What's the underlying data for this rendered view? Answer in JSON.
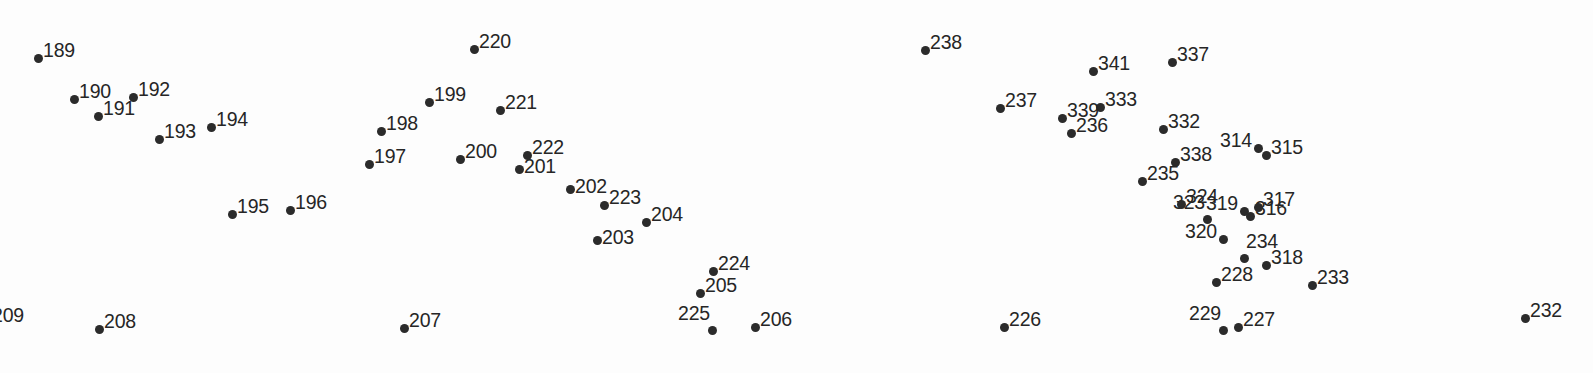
{
  "figure": {
    "type": "scatter-labeled-points",
    "width": 1593,
    "height": 373,
    "background_color": "#fdfdfd",
    "dot_color": "#2b2b2b",
    "label_color": "#262626",
    "label_font_size_px": 19.5,
    "dot_diameter_px": 9,
    "title": "",
    "xlabel": "",
    "ylabel": "",
    "grid": false,
    "axes_visible": false,
    "legend": "none"
  },
  "chart_data": {
    "type": "scatter",
    "title": "",
    "xlabel": "",
    "ylabel": "",
    "grid": false,
    "legend": "none",
    "xlim": [
      0,
      1593
    ],
    "ylim": [
      0,
      373
    ],
    "note": "Each point is a filled dot annotated with a numeric identifier label. Coordinates are in screenshot pixel space; y increases downward.",
    "points": [
      {
        "label": "189",
        "x": 38,
        "y": 58,
        "label_pos": "right"
      },
      {
        "label": "190",
        "x": 74,
        "y": 99,
        "label_pos": "right"
      },
      {
        "label": "191",
        "x": 98,
        "y": 116,
        "label_pos": "right"
      },
      {
        "label": "192",
        "x": 133,
        "y": 97,
        "label_pos": "right"
      },
      {
        "label": "193",
        "x": 159,
        "y": 139,
        "label_pos": "right"
      },
      {
        "label": "194",
        "x": 211,
        "y": 127,
        "label_pos": "right"
      },
      {
        "label": "195",
        "x": 232,
        "y": 214,
        "label_pos": "right"
      },
      {
        "label": "196",
        "x": 290,
        "y": 210,
        "label_pos": "right"
      },
      {
        "label": "197",
        "x": 369,
        "y": 164,
        "label_pos": "right"
      },
      {
        "label": "198",
        "x": 381,
        "y": 131,
        "label_pos": "right"
      },
      {
        "label": "199",
        "x": 429,
        "y": 102,
        "label_pos": "right"
      },
      {
        "label": "200",
        "x": 460,
        "y": 159,
        "label_pos": "right"
      },
      {
        "label": "201",
        "x": 519,
        "y": 169,
        "label_pos": "right-low"
      },
      {
        "label": "202",
        "x": 570,
        "y": 189,
        "label_pos": "right-low"
      },
      {
        "label": "203",
        "x": 597,
        "y": 240,
        "label_pos": "right-low"
      },
      {
        "label": "204",
        "x": 646,
        "y": 222,
        "label_pos": "right"
      },
      {
        "label": "205",
        "x": 700,
        "y": 293,
        "label_pos": "right"
      },
      {
        "label": "206",
        "x": 755,
        "y": 327,
        "label_pos": "right"
      },
      {
        "label": "207",
        "x": 404,
        "y": 328,
        "label_pos": "right"
      },
      {
        "label": "208",
        "x": 99,
        "y": 329,
        "label_pos": "right"
      },
      {
        "label": "209",
        "x": 0,
        "y": 318,
        "label_pos": "clipped-left"
      },
      {
        "label": "220",
        "x": 474,
        "y": 49,
        "label_pos": "right"
      },
      {
        "label": "221",
        "x": 500,
        "y": 110,
        "label_pos": "right"
      },
      {
        "label": "222",
        "x": 527,
        "y": 155,
        "label_pos": "right"
      },
      {
        "label": "223",
        "x": 604,
        "y": 205,
        "label_pos": "right"
      },
      {
        "label": "224",
        "x": 713,
        "y": 271,
        "label_pos": "right"
      },
      {
        "label": "225",
        "x": 712,
        "y": 330,
        "label_pos": "top-left"
      },
      {
        "label": "226",
        "x": 1004,
        "y": 327,
        "label_pos": "right"
      },
      {
        "label": "227",
        "x": 1238,
        "y": 327,
        "label_pos": "right"
      },
      {
        "label": "228",
        "x": 1216,
        "y": 282,
        "label_pos": "right"
      },
      {
        "label": "229",
        "x": 1223,
        "y": 330,
        "label_pos": "top-left"
      },
      {
        "label": "232",
        "x": 1525,
        "y": 318,
        "label_pos": "right"
      },
      {
        "label": "233",
        "x": 1312,
        "y": 285,
        "label_pos": "right"
      },
      {
        "label": "234",
        "x": 1244,
        "y": 258,
        "label_pos": "top-right"
      },
      {
        "label": "235",
        "x": 1142,
        "y": 181,
        "label_pos": "right"
      },
      {
        "label": "236",
        "x": 1071,
        "y": 133,
        "label_pos": "right"
      },
      {
        "label": "237",
        "x": 1000,
        "y": 108,
        "label_pos": "right"
      },
      {
        "label": "238",
        "x": 925,
        "y": 50,
        "label_pos": "right"
      },
      {
        "label": "314",
        "x": 1258,
        "y": 148,
        "label_pos": "left"
      },
      {
        "label": "315",
        "x": 1266,
        "y": 155,
        "label_pos": "right"
      },
      {
        "label": "316",
        "x": 1250,
        "y": 216,
        "label_pos": "right"
      },
      {
        "label": "317",
        "x": 1258,
        "y": 207,
        "label_pos": "right"
      },
      {
        "label": "318",
        "x": 1266,
        "y": 265,
        "label_pos": "right"
      },
      {
        "label": "319",
        "x": 1244,
        "y": 211,
        "label_pos": "left"
      },
      {
        "label": "320",
        "x": 1223,
        "y": 239,
        "label_pos": "left"
      },
      {
        "label": "323",
        "x": 1207,
        "y": 219,
        "label_pos": "top-left"
      },
      {
        "label": "324",
        "x": 1181,
        "y": 204,
        "label_pos": "right"
      },
      {
        "label": "332",
        "x": 1163,
        "y": 129,
        "label_pos": "right"
      },
      {
        "label": "333",
        "x": 1100,
        "y": 107,
        "label_pos": "right"
      },
      {
        "label": "337",
        "x": 1172,
        "y": 62,
        "label_pos": "right"
      },
      {
        "label": "338",
        "x": 1175,
        "y": 162,
        "label_pos": "right"
      },
      {
        "label": "339",
        "x": 1062,
        "y": 118,
        "label_pos": "right"
      },
      {
        "label": "341",
        "x": 1093,
        "y": 71,
        "label_pos": "right"
      }
    ]
  },
  "clipped": {
    "left_edge_label": "209"
  }
}
